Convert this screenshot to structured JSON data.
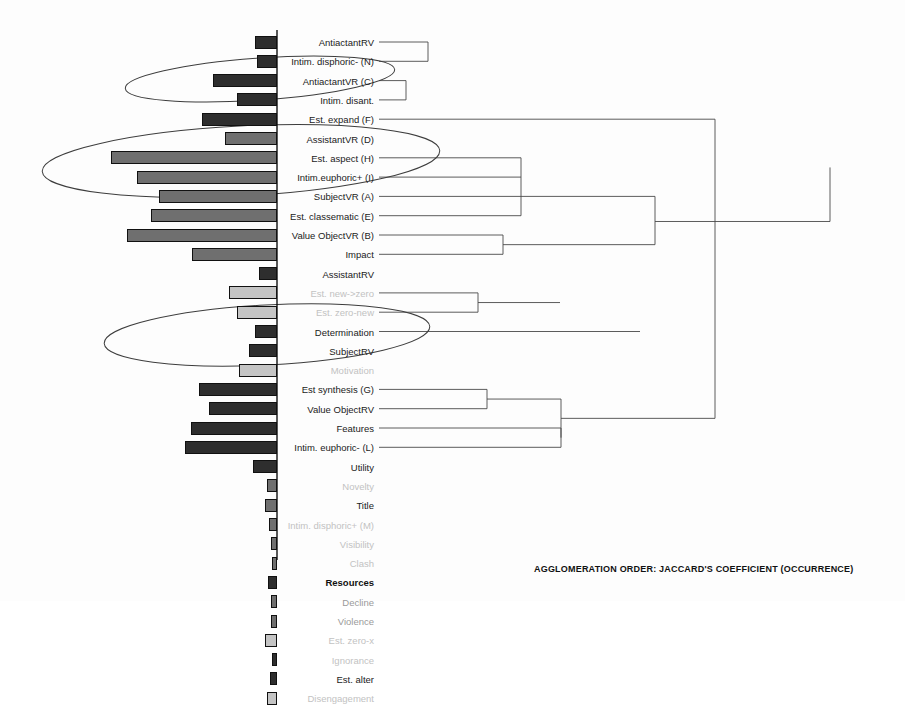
{
  "figure": {
    "caption": "AGGLOMERATION ORDER: JACCARD'S COEFFICIENT (OCCURRENCE)",
    "axis_x": 277,
    "row_start_y": 42,
    "row_step": 19.3,
    "colors": {
      "bar_dark": "#2e2e2e",
      "bar_mid": "#6f6f6f",
      "bar_light": "#c4c4c4",
      "bar_stroke": "#111111",
      "line": "#4a4a4a",
      "ellipse": "#3d3d3d",
      "axis": "#111111",
      "label_strong": "#1b1b1b",
      "label_faint": "#c2c2c2"
    }
  },
  "chart_data": {
    "type": "bar",
    "title": "AGGLOMERATION ORDER: JACCARD'S COEFFICIENT (OCCURRENCE)",
    "xlabel": "",
    "ylabel": "",
    "grid": false,
    "legend": "none",
    "orientation": "horizontal-left",
    "note": "Horizontal bars extend leftward from a vertical baseline; a dendrogram of agglomeration order extends rightward from the same labels.",
    "categories": [
      "AntiactantRV",
      "Intim. disphoric- (N)",
      "AntiactantVR (C)",
      "Intim. disant.",
      "Est. expand (F)",
      "AssistantVR (D)",
      "Est. aspect (H)",
      "Intim.euphoric+ (I)",
      "SubjectVR (A)",
      "Est. classematic (E)",
      "Value ObjectVR (B)",
      "Impact",
      "AssistantRV",
      "Est. new->zero",
      "Est. zero-new",
      "Determination",
      "SubjectRV",
      "Motivation",
      "Est synthesis (G)",
      "Value ObjectRV",
      "Features",
      "Intim. euphoric- (L)",
      "Utility",
      "Novelty",
      "Title",
      "Intim. disphoric+ (M)",
      "Visibility",
      "Clash",
      "Resources",
      "Decline",
      "Violence",
      "Est. zero-x",
      "Ignorance",
      "Est. alter",
      "Disengagement"
    ],
    "values": [
      22,
      20,
      64,
      40,
      75,
      52,
      166,
      140,
      118,
      126,
      150,
      85,
      18,
      48,
      40,
      22,
      28,
      38,
      78,
      68,
      86,
      92,
      24,
      10,
      12,
      8,
      6,
      5,
      9,
      6,
      6,
      12,
      5,
      7,
      10
    ],
    "shades": [
      "dark",
      "dark",
      "dark",
      "dark",
      "dark",
      "mid",
      "mid",
      "mid",
      "mid",
      "mid",
      "mid",
      "mid",
      "dark",
      "light",
      "light",
      "dark",
      "dark",
      "light",
      "dark",
      "dark",
      "dark",
      "dark",
      "dark",
      "mid",
      "mid",
      "mid",
      "mid",
      "mid",
      "dark",
      "mid",
      "mid",
      "light",
      "dark",
      "dark",
      "light"
    ],
    "label_emphasis": [
      "strong",
      "strong",
      "strong",
      "strong",
      "strong",
      "strong",
      "strong",
      "strong",
      "strong",
      "strong",
      "strong",
      "strong",
      "strong",
      "faint",
      "faint",
      "strong",
      "strong",
      "faint",
      "strong",
      "strong",
      "strong",
      "strong",
      "strong",
      "faint",
      "strong",
      "faint",
      "faint",
      "faint",
      "bold",
      "mid",
      "mid",
      "faint",
      "faint",
      "strong",
      "faint"
    ],
    "dendrogram_merges": [
      {
        "leaves": [
          0,
          1
        ],
        "x": 428
      },
      {
        "leaves": [
          2,
          3
        ],
        "x": 406
      },
      {
        "leaves": [
          4
        ],
        "x": 621
      },
      {
        "leaves": [
          6,
          7,
          8,
          9
        ],
        "x": 521
      },
      {
        "leaves": [
          10,
          11
        ],
        "x": 503
      },
      {
        "leaves": [
          13,
          14
        ],
        "x": 478
      },
      {
        "leaves": [
          15
        ],
        "x": 583
      },
      {
        "leaves": [
          18,
          19
        ],
        "x": 487
      },
      {
        "leaves": [
          20,
          21
        ],
        "x": 561
      },
      {
        "leaves": [
          29,
          30
        ],
        "x": 637
      }
    ],
    "ellipses": [
      {
        "cx": 260,
        "cy": 79,
        "rx": 135,
        "ry": 21,
        "rot": -4,
        "label": "cluster-1"
      },
      {
        "cx": 241,
        "cy": 161,
        "rx": 199,
        "ry": 35,
        "rot": -3,
        "label": "cluster-2"
      },
      {
        "cx": 267,
        "cy": 335,
        "rx": 163,
        "ry": 30,
        "rot": -3,
        "label": "cluster-3"
      }
    ]
  }
}
